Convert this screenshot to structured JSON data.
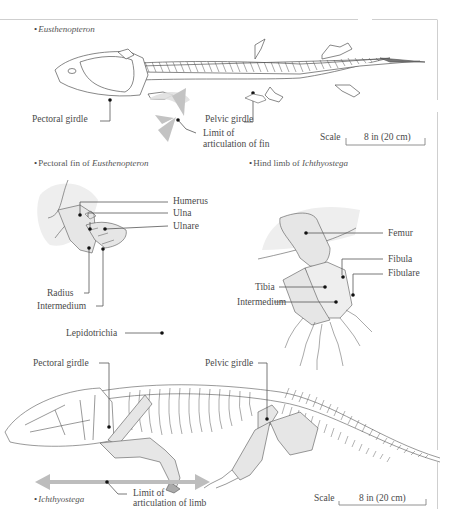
{
  "figure": {
    "border_color": "#cfcfcf",
    "fill_bone": "#e6e6e6",
    "fill_shadow": "#eeeeee",
    "arrow_gray": "#bdbdbd",
    "line_color": "#555555"
  },
  "eusthenopteron": {
    "title_prefix": "",
    "title_italic": "Eusthenopteron",
    "labels": {
      "pectoral_girdle": "Pectoral girdle",
      "pelvic_girdle": "Pelvic girdle",
      "limit_line1": "Limit of",
      "limit_line2": "articulation of fin"
    },
    "scale": {
      "label": "Scale",
      "value": "8 in (20 cm)"
    }
  },
  "pectoral_fin": {
    "title_prefix": "Pectoral fin of ",
    "title_italic": "Eusthenopteron",
    "labels": {
      "humerus": "Humerus",
      "ulna": "Ulna",
      "ulnare": "Ulnare",
      "radius": "Radius",
      "intermedium": "Intermedium",
      "lepidotrichia": "Lepidotrichia"
    }
  },
  "hind_limb": {
    "title_prefix": "Hind limb of ",
    "title_italic": "Ichthyostega",
    "labels": {
      "femur": "Femur",
      "fibula": "Fibula",
      "fibulare": "Fibulare",
      "tibia": "Tibia",
      "intermedium": "Intermedium"
    }
  },
  "ichthyostega": {
    "title_prefix": "",
    "title_italic": "Ichthyostega",
    "labels": {
      "pectoral_girdle": "Pectoral girdle",
      "pelvic_girdle": "Pelvic girdle",
      "limit_line1": "Limit of",
      "limit_line2": "articulation of limb"
    },
    "scale": {
      "label": "Scale",
      "value": "8 in (20 cm)"
    }
  }
}
